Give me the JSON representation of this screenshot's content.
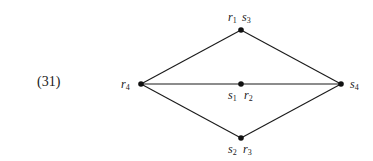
{
  "equation_number": "(31)",
  "graph": {
    "nodes": [
      {
        "id": "top",
        "x": 241,
        "y": 30,
        "labels": [
          {
            "base": "r",
            "sub": "1"
          },
          {
            "base": "s",
            "sub": "3"
          }
        ]
      },
      {
        "id": "left",
        "x": 141,
        "y": 84,
        "labels": [
          {
            "base": "r",
            "sub": "4"
          }
        ]
      },
      {
        "id": "middle",
        "x": 241,
        "y": 84,
        "labels": [
          {
            "base": "s",
            "sub": "1"
          },
          {
            "base": "r",
            "sub": "2"
          }
        ]
      },
      {
        "id": "right",
        "x": 341,
        "y": 84,
        "labels": [
          {
            "base": "s",
            "sub": "4"
          }
        ]
      },
      {
        "id": "bottom",
        "x": 241,
        "y": 138,
        "labels": [
          {
            "base": "s",
            "sub": "2"
          },
          {
            "base": "r",
            "sub": "3"
          }
        ]
      }
    ],
    "edges": [
      [
        "left",
        "top"
      ],
      [
        "top",
        "right"
      ],
      [
        "left",
        "middle"
      ],
      [
        "middle",
        "right"
      ],
      [
        "left",
        "bottom"
      ],
      [
        "bottom",
        "right"
      ]
    ]
  },
  "labels": {
    "top_r": "r",
    "top_r_sub": "1",
    "top_s": "s",
    "top_s_sub": "3",
    "left_r": "r",
    "left_r_sub": "4",
    "mid_s": "s",
    "mid_s_sub": "1",
    "mid_r": "r",
    "mid_r_sub": "2",
    "right_s": "s",
    "right_s_sub": "4",
    "bot_s": "s",
    "bot_s_sub": "2",
    "bot_r": "r",
    "bot_r_sub": "3"
  }
}
